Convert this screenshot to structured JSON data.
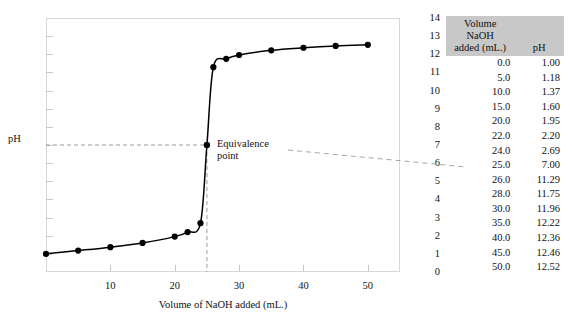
{
  "chart_data": {
    "type": "line",
    "title": "",
    "xlabel": "Volume of NaOH added (mL.)",
    "ylabel": "pH",
    "xlim": [
      0,
      55
    ],
    "ylim": [
      0,
      14
    ],
    "grid": false,
    "legend": "none",
    "x_ticks": [
      10,
      20,
      30,
      40,
      50
    ],
    "y_ticks": [
      0,
      1,
      2,
      3,
      4,
      5,
      6,
      7,
      8,
      9,
      10,
      11,
      12,
      13,
      14
    ],
    "x": [
      0.0,
      5.0,
      10.0,
      15.0,
      20.0,
      22.0,
      24.0,
      25.0,
      26.0,
      28.0,
      30.0,
      35.0,
      40.0,
      45.0,
      50.0
    ],
    "values": [
      1.0,
      1.18,
      1.37,
      1.6,
      1.95,
      2.2,
      2.69,
      7.0,
      11.29,
      11.75,
      11.96,
      12.22,
      12.36,
      12.46,
      12.52
    ],
    "annotations": [
      {
        "label": "Equivalence\npoint",
        "x": 25.0,
        "y": 7.0,
        "marker": "dot",
        "guide_lines": [
          "horizontal-dashed-to-axis",
          "vertical-dashed-to-axis"
        ],
        "leader_to": "table-row-25.0"
      }
    ]
  },
  "table": {
    "headers": {
      "volume_line1": "Volume NaOH",
      "volume_line2": "added (mL.)",
      "ph": "pH"
    },
    "rows": [
      {
        "volume": "0.0",
        "ph": "1.00"
      },
      {
        "volume": "5.0",
        "ph": "1.18"
      },
      {
        "volume": "10.0",
        "ph": "1.37"
      },
      {
        "volume": "15.0",
        "ph": "1.60"
      },
      {
        "volume": "20.0",
        "ph": "1.95"
      },
      {
        "volume": "22.0",
        "ph": "2.20"
      },
      {
        "volume": "24.0",
        "ph": "2.69"
      },
      {
        "volume": "25.0",
        "ph": "7.00"
      },
      {
        "volume": "26.0",
        "ph": "11.29"
      },
      {
        "volume": "28.0",
        "ph": "11.75"
      },
      {
        "volume": "30.0",
        "ph": "11.96"
      },
      {
        "volume": "35.0",
        "ph": "12.22"
      },
      {
        "volume": "40.0",
        "ph": "12.36"
      },
      {
        "volume": "45.0",
        "ph": "12.46"
      },
      {
        "volume": "50.0",
        "ph": "12.52"
      }
    ]
  },
  "colors": {
    "curve": "#000000",
    "marker": "#000000",
    "frame": "#d8d8d8",
    "tick": "#c9c9c9",
    "guide": "#9a9a9a",
    "header_band": "#c8c8c8",
    "background": "#ffffff"
  }
}
